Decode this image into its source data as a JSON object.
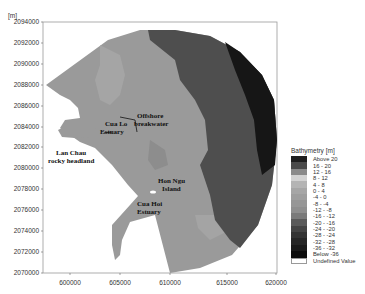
{
  "map": {
    "unit_label": "[m]",
    "y_ticks": [
      "2094000",
      "2092000",
      "2090000",
      "2088000",
      "2086000",
      "2084000",
      "2082000",
      "2080000",
      "2078000",
      "2076000",
      "2074000",
      "2072000",
      "2070000"
    ],
    "x_ticks": [
      "600000",
      "605000",
      "610000",
      "615000",
      "620000"
    ],
    "annotations": {
      "cua_lo": [
        "Cua Lo",
        "Estuary"
      ],
      "offshore": [
        "Offshore",
        "breakwater"
      ],
      "lan_chau": [
        "Lan Chau",
        "rocky headland"
      ],
      "hon_ngu": [
        "Hon Ngu",
        "Island"
      ],
      "cua_hoi": [
        "Cua Hoi",
        "Estuary"
      ]
    },
    "colors": {
      "shallow": "#9a9a9a",
      "mid": "#8c8c8c",
      "light_patch": "#a6a6a6",
      "deep": "#4d4d4d",
      "deepest": "#151515",
      "land": "#ffffff"
    }
  },
  "legend": {
    "title": "Bathymetry [m]",
    "items": [
      {
        "label": "Above  20",
        "color": "#1e1e1e"
      },
      {
        "label": "16 -  20",
        "color": "#4a4a4a"
      },
      {
        "label": "12 -  16",
        "color": "#8a8a8a"
      },
      {
        "label": "8 -  12",
        "color": "#d2d2d2"
      },
      {
        "label": "4 -  8",
        "color": "#b4b4b4"
      },
      {
        "label": "0 -  4",
        "color": "#a6a6a6"
      },
      {
        "label": "-4 -  0",
        "color": "#9e9e9e"
      },
      {
        "label": "-8 -  -4",
        "color": "#969696"
      },
      {
        "label": "-12 -  -8",
        "color": "#8e8e8e"
      },
      {
        "label": "-16 - -12",
        "color": "#7a7a7a"
      },
      {
        "label": "-20 - -16",
        "color": "#5a5a5a"
      },
      {
        "label": "-24 - -20",
        "color": "#444444"
      },
      {
        "label": "-28 - -24",
        "color": "#333333"
      },
      {
        "label": "-32 - -28",
        "color": "#262626"
      },
      {
        "label": "-36 - -32",
        "color": "#1a1a1a"
      },
      {
        "label": "Below  -36",
        "color": "#0c0c0c"
      },
      {
        "label": "Undefined Value",
        "color": "#ffffff"
      }
    ]
  },
  "chart_data": {
    "type": "heatmap",
    "title": "Bathymetry [m]",
    "xlabel": "",
    "ylabel": "[m]",
    "xlim": [
      597000,
      620000
    ],
    "ylim": [
      2070000,
      2094000
    ],
    "x_ticks": [
      600000,
      605000,
      610000,
      615000,
      620000
    ],
    "y_ticks": [
      2070000,
      2072000,
      2074000,
      2076000,
      2078000,
      2080000,
      2082000,
      2084000,
      2086000,
      2088000,
      2090000,
      2092000,
      2094000
    ],
    "legend_classes": [
      "Above 20",
      "16 - 20",
      "12 - 16",
      "8 - 12",
      "4 - 8",
      "0 - 4",
      "-4 - 0",
      "-8 - -4",
      "-12 - -8",
      "-16 - -12",
      "-20 - -16",
      "-24 - -20",
      "-28 - -24",
      "-32 - -28",
      "-36 - -32",
      "Below -36",
      "Undefined Value"
    ],
    "annotations": [
      "Cua Lo Estuary",
      "Offshore breakwater",
      "Lan Chau rocky headland",
      "Hon Ngu Island",
      "Cua Hoi Estuary"
    ],
    "grid": false,
    "legend_position": "right"
  }
}
